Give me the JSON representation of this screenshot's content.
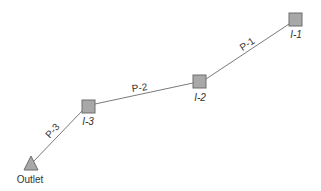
{
  "diagram": {
    "type": "pipe-network",
    "colors": {
      "node_fill": "#a8a8a8",
      "node_stroke": "#6e6e6e",
      "pipe": "#7a7a7a",
      "text": "#333333"
    },
    "nodes": [
      {
        "id": "I-1",
        "label": "I-1",
        "shape": "square"
      },
      {
        "id": "I-2",
        "label": "I-2",
        "shape": "square"
      },
      {
        "id": "I-3",
        "label": "I-3",
        "shape": "square"
      },
      {
        "id": "Outlet",
        "label": "Outlet",
        "shape": "triangle"
      }
    ],
    "links": [
      {
        "id": "P-1",
        "label": "P-1",
        "from": "I-1",
        "to": "I-2"
      },
      {
        "id": "P-2",
        "label": "P-2",
        "from": "I-2",
        "to": "I-3"
      },
      {
        "id": "P-3",
        "label": "P-3",
        "from": "I-3",
        "to": "Outlet"
      }
    ]
  }
}
